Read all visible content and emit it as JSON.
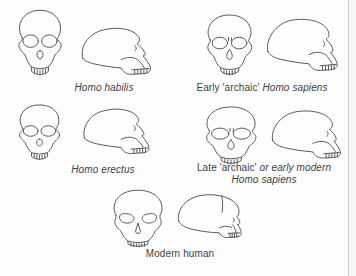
{
  "page": {
    "background_color": "#fdfdfd",
    "line_art_color": "#5a5a5a",
    "text_color": "#3d3d3d",
    "right_edge_line_color": "#cfcfcf"
  },
  "figure": {
    "groups": [
      {
        "id": "homo-habilis",
        "label": [
          {
            "text": "Homo habilis",
            "italic": true
          }
        ]
      },
      {
        "id": "early-archaic-homo-sapiens",
        "label": [
          {
            "text": "Early 'archaic' ",
            "italic": false
          },
          {
            "text": "Homo sapiens",
            "italic": true
          }
        ]
      },
      {
        "id": "homo-erectus",
        "label": [
          {
            "text": "Homo erectus",
            "italic": true
          }
        ]
      },
      {
        "id": "late-archaic-or-early-modern-homo-sapiens",
        "label": [
          {
            "text": "Late 'archaic' ",
            "italic": false
          },
          {
            "text": "or early modern",
            "italic": true
          }
        ],
        "label_line2": [
          {
            "text": "Homo sapiens",
            "italic": true
          }
        ]
      },
      {
        "id": "modern-human",
        "label": [
          {
            "text": "Modern human",
            "italic": false
          }
        ]
      }
    ]
  }
}
